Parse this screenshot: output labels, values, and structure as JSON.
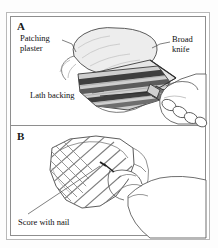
{
  "figure": {
    "type": "technical-illustration",
    "ghost_text": " ",
    "panels": [
      {
        "letter": "A",
        "name": "panel-a",
        "labels": [
          {
            "name": "patching-plaster",
            "text": "Patching\nplaster"
          },
          {
            "name": "broad-knife",
            "text": "Broad\nknife"
          },
          {
            "name": "lath-backing",
            "text": "Lath backing"
          }
        ]
      },
      {
        "letter": "B",
        "name": "panel-b",
        "labels": [
          {
            "name": "score-with-nail",
            "text": "Score with nail"
          }
        ]
      }
    ]
  },
  "colors": {
    "ink": "#101010",
    "frame_outer": "#b9b9b9",
    "frame_inner": "#8e8e8e",
    "plaster_fill": "#ededed",
    "plaster_shade": "#dcdcdc",
    "lath_dark": "#4a4a4a",
    "lath_mid": "#8a8a8a",
    "paper": "#ffffff"
  }
}
